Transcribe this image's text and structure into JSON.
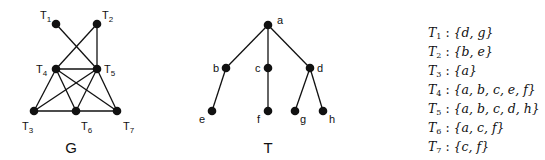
{
  "graph_G": {
    "caption": "G",
    "nodes": [
      {
        "id": "T1",
        "base": "T",
        "sub": "1",
        "x": 56,
        "y": 24,
        "lx": 40,
        "ly": 19
      },
      {
        "id": "T2",
        "base": "T",
        "sub": "2",
        "x": 97,
        "y": 24,
        "lx": 102,
        "ly": 19
      },
      {
        "id": "T4",
        "base": "T",
        "sub": "4",
        "x": 56,
        "y": 69,
        "lx": 36,
        "ly": 73
      },
      {
        "id": "T5",
        "base": "T",
        "sub": "5",
        "x": 97,
        "y": 69,
        "lx": 104,
        "ly": 73
      },
      {
        "id": "T3",
        "base": "T",
        "sub": "3",
        "x": 34,
        "y": 111,
        "lx": 22,
        "ly": 130
      },
      {
        "id": "T6",
        "base": "T",
        "sub": "6",
        "x": 76,
        "y": 111,
        "lx": 81,
        "ly": 130
      },
      {
        "id": "T7",
        "base": "T",
        "sub": "7",
        "x": 117,
        "y": 111,
        "lx": 123,
        "ly": 130
      }
    ],
    "edges": [
      [
        "T1",
        "T5"
      ],
      [
        "T2",
        "T4"
      ],
      [
        "T2",
        "T5"
      ],
      [
        "T4",
        "T5"
      ],
      [
        "T4",
        "T3"
      ],
      [
        "T4",
        "T6"
      ],
      [
        "T4",
        "T7"
      ],
      [
        "T5",
        "T3"
      ],
      [
        "T5",
        "T6"
      ],
      [
        "T5",
        "T7"
      ],
      [
        "T3",
        "T6"
      ],
      [
        "T6",
        "T7"
      ]
    ]
  },
  "tree_T": {
    "caption": "T",
    "nodes": [
      {
        "id": "a",
        "x": 268,
        "y": 25,
        "lx": 277,
        "ly": 24
      },
      {
        "id": "b",
        "x": 226,
        "y": 68,
        "lx": 213,
        "ly": 72
      },
      {
        "id": "c",
        "x": 268,
        "y": 68,
        "lx": 255,
        "ly": 72
      },
      {
        "id": "d",
        "x": 310,
        "y": 68,
        "lx": 317,
        "ly": 72
      },
      {
        "id": "e",
        "x": 212,
        "y": 111,
        "lx": 199,
        "ly": 123
      },
      {
        "id": "f",
        "x": 268,
        "y": 111,
        "lx": 257,
        "ly": 123
      },
      {
        "id": "g",
        "x": 295,
        "y": 111,
        "lx": 300,
        "ly": 123
      },
      {
        "id": "h",
        "x": 323,
        "y": 111,
        "lx": 329,
        "ly": 123
      }
    ],
    "edges": [
      [
        "a",
        "b"
      ],
      [
        "a",
        "c"
      ],
      [
        "a",
        "d"
      ],
      [
        "b",
        "e"
      ],
      [
        "c",
        "f"
      ],
      [
        "d",
        "g"
      ],
      [
        "d",
        "h"
      ]
    ]
  },
  "bags": [
    {
      "base": "T",
      "sub": "1",
      "set": "{d, g}"
    },
    {
      "base": "T",
      "sub": "2",
      "set": "{b, e}"
    },
    {
      "base": "T",
      "sub": "3",
      "set": "{a}"
    },
    {
      "base": "T",
      "sub": "4",
      "set": "{a, b, c, e, f}"
    },
    {
      "base": "T",
      "sub": "5",
      "set": "{a, b, c, d, h}"
    },
    {
      "base": "T",
      "sub": "6",
      "set": "{a, c, f}"
    },
    {
      "base": "T",
      "sub": "7",
      "set": "{c, f}"
    }
  ]
}
